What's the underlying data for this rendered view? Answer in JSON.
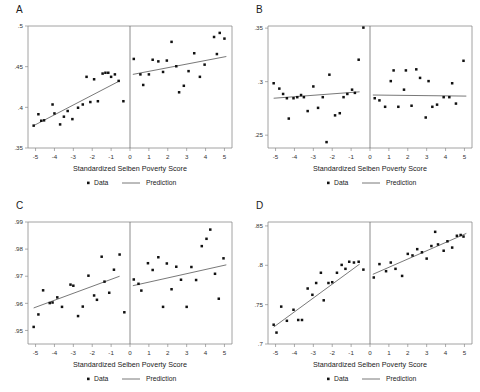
{
  "figure": {
    "background_color": "#ffffff",
    "point_color": "#111111",
    "line_color": "#555555",
    "frame_color": "#8a8a8a",
    "panel_order": [
      "A",
      "B",
      "C",
      "D"
    ]
  },
  "shared": {
    "xlabel": "Standardized Selben Poverty Score",
    "xtick_labels": [
      "-5",
      "-4",
      "-3",
      "-2",
      "-1",
      "0",
      "1",
      "2",
      "3",
      "4",
      "5"
    ],
    "xlim": [
      -5.4,
      5.4
    ],
    "xticks": [
      -5,
      -4,
      -3,
      -2,
      -1,
      0,
      1,
      2,
      3,
      4,
      5
    ],
    "cutoff": 0,
    "legend": {
      "data_label": "Data",
      "prediction_label": "Prediction",
      "data_marker": "dot-marker-icon",
      "prediction_marker": "line-marker-icon",
      "position": "below-axis-centered"
    },
    "grid": false
  },
  "chart_data": [
    {
      "type": "scatter",
      "panel": "A",
      "title": "A",
      "xlabel": "Standardized Selben Poverty Score",
      "ylabel": "",
      "xlim": [
        -5.4,
        5.4
      ],
      "ylim": [
        0.35,
        0.5
      ],
      "yticks": [
        0.35,
        0.4,
        0.45,
        0.5
      ],
      "ytick_labels": [
        ".35",
        ".4",
        ".45",
        ".5"
      ],
      "cutoff": 0,
      "series": [
        {
          "name": "Data",
          "marker": "dot",
          "points_left": [
            [
              -5.1,
              0.3775
            ],
            [
              -4.85,
              0.3915
            ],
            [
              -4.7,
              0.3835
            ],
            [
              -4.55,
              0.384
            ],
            [
              -4.1,
              0.4035
            ],
            [
              -4.0,
              0.3925
            ],
            [
              -3.7,
              0.379
            ],
            [
              -3.5,
              0.3885
            ],
            [
              -3.3,
              0.3955
            ],
            [
              -3.05,
              0.3855
            ],
            [
              -2.75,
              0.3995
            ],
            [
              -2.5,
              0.4035
            ],
            [
              -2.3,
              0.4375
            ],
            [
              -2.1,
              0.4065
            ],
            [
              -1.9,
              0.4345
            ],
            [
              -1.7,
              0.4075
            ],
            [
              -1.45,
              0.4415
            ],
            [
              -1.3,
              0.4425
            ],
            [
              -1.15,
              0.4425
            ],
            [
              -1.0,
              0.4375
            ],
            [
              -0.8,
              0.4405
            ],
            [
              -0.6,
              0.4325
            ],
            [
              -0.35,
              0.4075
            ]
          ],
          "points_right": [
            [
              0.2,
              0.4595
            ],
            [
              0.55,
              0.4405
            ],
            [
              0.7,
              0.4275
            ],
            [
              1.0,
              0.4405
            ],
            [
              1.2,
              0.4585
            ],
            [
              1.5,
              0.4565
            ],
            [
              1.75,
              0.4435
            ],
            [
              1.95,
              0.4575
            ],
            [
              2.2,
              0.4805
            ],
            [
              2.45,
              0.4505
            ],
            [
              2.6,
              0.4185
            ],
            [
              2.85,
              0.4265
            ],
            [
              3.1,
              0.4445
            ],
            [
              3.4,
              0.4665
            ],
            [
              3.7,
              0.4375
            ],
            [
              3.95,
              0.4525
            ],
            [
              4.45,
              0.4865
            ],
            [
              4.6,
              0.4655
            ],
            [
              4.75,
              0.4915
            ],
            [
              5.0,
              0.4845
            ]
          ]
        },
        {
          "name": "Prediction",
          "marker": "line",
          "line_left": [
            [
              -5.1,
              0.3775
            ],
            [
              -0.55,
              0.4325
            ]
          ],
          "line_right": [
            [
              0.15,
              0.4405
            ],
            [
              5.1,
              0.4625
            ]
          ]
        }
      ]
    },
    {
      "type": "scatter",
      "panel": "B",
      "title": "B",
      "xlabel": "Standardized Selben Poverty Score",
      "ylabel": "",
      "xlim": [
        -5.4,
        5.4
      ],
      "ylim": [
        0.238,
        0.352
      ],
      "yticks": [
        0.25,
        0.3,
        0.35
      ],
      "ytick_labels": [
        ".25",
        ".3",
        ".35"
      ],
      "cutoff": 0,
      "series": [
        {
          "name": "Data",
          "marker": "dot",
          "points_left": [
            [
              -5.1,
              0.2985
            ],
            [
              -4.8,
              0.2935
            ],
            [
              -4.6,
              0.2885
            ],
            [
              -4.4,
              0.2845
            ],
            [
              -4.3,
              0.2655
            ],
            [
              -4.05,
              0.2845
            ],
            [
              -3.85,
              0.2855
            ],
            [
              -3.65,
              0.2875
            ],
            [
              -3.5,
              0.2855
            ],
            [
              -3.3,
              0.2725
            ],
            [
              -3.0,
              0.2955
            ],
            [
              -2.75,
              0.2755
            ],
            [
              -2.5,
              0.2855
            ],
            [
              -2.3,
              0.2435
            ],
            [
              -2.15,
              0.3065
            ],
            [
              -1.85,
              0.2685
            ],
            [
              -1.6,
              0.2705
            ],
            [
              -1.4,
              0.2855
            ],
            [
              -1.2,
              0.2885
            ],
            [
              -0.95,
              0.2925
            ],
            [
              -0.8,
              0.2895
            ],
            [
              -0.6,
              0.3205
            ],
            [
              -0.35,
              0.3505
            ]
          ],
          "points_right": [
            [
              0.25,
              0.2845
            ],
            [
              0.5,
              0.2825
            ],
            [
              0.8,
              0.2765
            ],
            [
              1.1,
              0.3005
            ],
            [
              1.25,
              0.3105
            ],
            [
              1.5,
              0.2765
            ],
            [
              1.8,
              0.2925
            ],
            [
              1.9,
              0.3105
            ],
            [
              2.2,
              0.2775
            ],
            [
              2.45,
              0.3115
            ],
            [
              2.65,
              0.3035
            ],
            [
              2.95,
              0.2665
            ],
            [
              3.1,
              0.3005
            ],
            [
              3.3,
              0.2765
            ],
            [
              3.55,
              0.2785
            ],
            [
              3.9,
              0.2855
            ],
            [
              4.2,
              0.2855
            ],
            [
              4.35,
              0.2985
            ],
            [
              4.55,
              0.2795
            ],
            [
              4.95,
              0.3195
            ]
          ]
        },
        {
          "name": "Prediction",
          "marker": "line",
          "line_left": [
            [
              -5.1,
              0.2845
            ],
            [
              -0.55,
              0.2905
            ]
          ],
          "line_right": [
            [
              0.15,
              0.2875
            ],
            [
              5.1,
              0.2865
            ]
          ]
        }
      ]
    },
    {
      "type": "scatter",
      "panel": "C",
      "title": "C",
      "xlabel": "Standardized Selben Poverty Score",
      "ylabel": "",
      "xlim": [
        -5.4,
        5.4
      ],
      "ylim": [
        0.945,
        0.99
      ],
      "yticks": [
        0.95,
        0.96,
        0.97,
        0.98,
        0.99
      ],
      "ytick_labels": [
        ".95",
        ".96",
        ".97",
        ".98",
        ".99"
      ],
      "cutoff": 0,
      "series": [
        {
          "name": "Data",
          "marker": "dot",
          "points_left": [
            [
              -5.1,
              0.9513
            ],
            [
              -4.85,
              0.9559
            ],
            [
              -4.6,
              0.9648
            ],
            [
              -4.25,
              0.9601
            ],
            [
              -4.1,
              0.9603
            ],
            [
              -3.85,
              0.9622
            ],
            [
              -3.6,
              0.9587
            ],
            [
              -3.15,
              0.9669
            ],
            [
              -3.0,
              0.9665
            ],
            [
              -2.75,
              0.9553
            ],
            [
              -2.5,
              0.9588
            ],
            [
              -2.2,
              0.9702
            ],
            [
              -1.9,
              0.9629
            ],
            [
              -1.75,
              0.9613
            ],
            [
              -1.5,
              0.9772
            ],
            [
              -1.35,
              0.968
            ],
            [
              -1.1,
              0.9639
            ],
            [
              -0.85,
              0.9724
            ],
            [
              -0.55,
              0.978
            ],
            [
              -0.3,
              0.9567
            ]
          ],
          "points_right": [
            [
              0.2,
              0.9688
            ],
            [
              0.45,
              0.9672
            ],
            [
              0.6,
              0.9647
            ],
            [
              0.95,
              0.9748
            ],
            [
              1.2,
              0.9723
            ],
            [
              1.5,
              0.977
            ],
            [
              1.75,
              0.9587
            ],
            [
              1.95,
              0.9747
            ],
            [
              2.2,
              0.9652
            ],
            [
              2.45,
              0.9735
            ],
            [
              2.7,
              0.9687
            ],
            [
              3.0,
              0.9587
            ],
            [
              3.25,
              0.9734
            ],
            [
              3.5,
              0.9686
            ],
            [
              3.8,
              0.9811
            ],
            [
              4.05,
              0.9838
            ],
            [
              4.25,
              0.9872
            ],
            [
              4.5,
              0.9709
            ],
            [
              4.7,
              0.9617
            ],
            [
              4.95,
              0.9766
            ]
          ]
        },
        {
          "name": "Prediction",
          "marker": "line",
          "line_left": [
            [
              -5.1,
              0.9583
            ],
            [
              -0.55,
              0.97
            ]
          ],
          "line_right": [
            [
              0.15,
              0.9665
            ],
            [
              5.1,
              0.9742
            ]
          ]
        }
      ]
    },
    {
      "type": "scatter",
      "panel": "D",
      "title": "D",
      "xlabel": "Standardized Selben Poverty Score",
      "ylabel": "",
      "xlim": [
        -5.4,
        5.4
      ],
      "ylim": [
        0.7,
        0.855
      ],
      "yticks": [
        0.7,
        0.75,
        0.8,
        0.85
      ],
      "ytick_labels": [
        ".7",
        ".75",
        ".8",
        ".85"
      ],
      "cutoff": 0,
      "series": [
        {
          "name": "Data",
          "marker": "dot",
          "points_left": [
            [
              -5.1,
              0.7245
            ],
            [
              -4.95,
              0.7145
            ],
            [
              -4.7,
              0.7475
            ],
            [
              -4.4,
              0.7295
            ],
            [
              -4.05,
              0.7435
            ],
            [
              -3.8,
              0.7305
            ],
            [
              -3.6,
              0.7305
            ],
            [
              -3.3,
              0.7705
            ],
            [
              -3.05,
              0.7625
            ],
            [
              -2.85,
              0.7775
            ],
            [
              -2.6,
              0.7905
            ],
            [
              -2.45,
              0.7555
            ],
            [
              -2.2,
              0.7775
            ],
            [
              -2.0,
              0.7785
            ],
            [
              -1.75,
              0.7905
            ],
            [
              -1.5,
              0.8005
            ],
            [
              -1.3,
              0.7955
            ],
            [
              -1.1,
              0.8045
            ],
            [
              -0.85,
              0.8035
            ],
            [
              -0.6,
              0.8045
            ],
            [
              -0.35,
              0.7945
            ]
          ],
          "points_right": [
            [
              0.2,
              0.7845
            ],
            [
              0.5,
              0.8015
            ],
            [
              0.85,
              0.7925
            ],
            [
              1.1,
              0.8035
            ],
            [
              1.35,
              0.7955
            ],
            [
              1.7,
              0.7865
            ],
            [
              2.0,
              0.8145
            ],
            [
              2.25,
              0.8125
            ],
            [
              2.5,
              0.8205
            ],
            [
              2.75,
              0.8165
            ],
            [
              3.0,
              0.8085
            ],
            [
              3.25,
              0.8245
            ],
            [
              3.45,
              0.8425
            ],
            [
              3.6,
              0.8265
            ],
            [
              3.9,
              0.8185
            ],
            [
              4.1,
              0.8305
            ],
            [
              4.35,
              0.8225
            ],
            [
              4.6,
              0.8375
            ],
            [
              4.8,
              0.8385
            ],
            [
              4.95,
              0.8365
            ]
          ]
        },
        {
          "name": "Prediction",
          "marker": "line",
          "line_left": [
            [
              -5.1,
              0.7215
            ],
            [
              -0.55,
              0.8015
            ]
          ],
          "line_right": [
            [
              0.15,
              0.7885
            ],
            [
              5.1,
              0.8405
            ]
          ]
        }
      ]
    }
  ]
}
